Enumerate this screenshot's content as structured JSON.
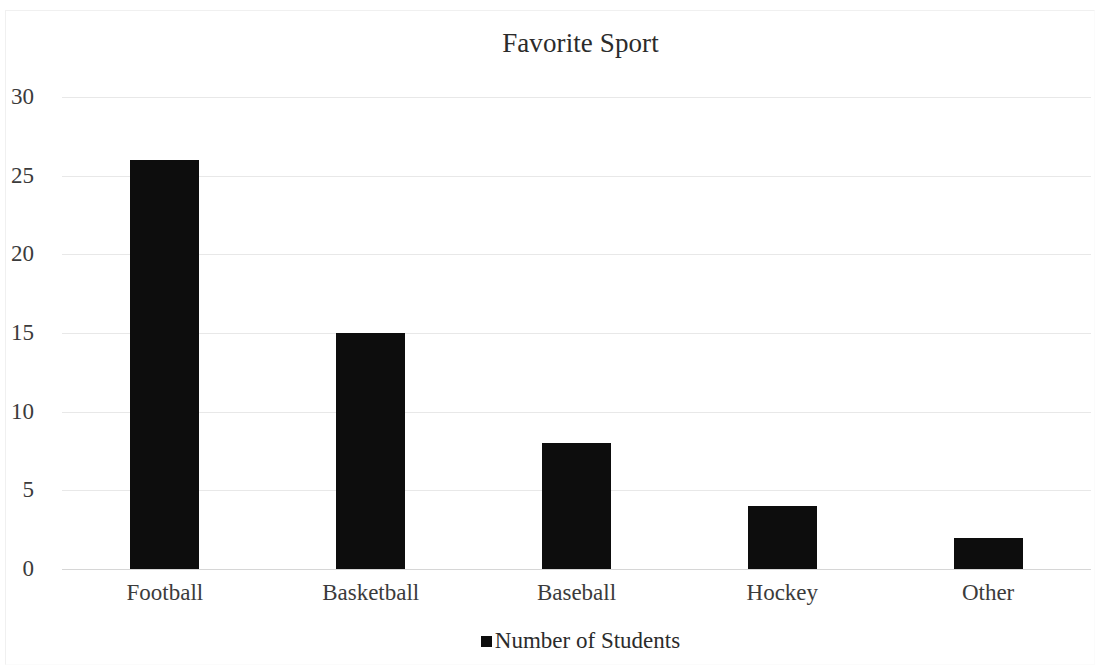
{
  "chart_data": {
    "type": "bar",
    "title": "Favorite Sport",
    "categories": [
      "Football",
      "Basketball",
      "Baseball",
      "Hockey",
      "Other"
    ],
    "values": [
      26,
      15,
      8,
      4,
      2
    ],
    "series": [
      {
        "name": "Number of Students",
        "values": [
          26,
          15,
          8,
          4,
          2
        ],
        "color": "#0d0d0d"
      }
    ],
    "xlabel": "",
    "ylabel": "",
    "ylim": [
      0,
      30
    ],
    "yticks": [
      0,
      5,
      10,
      15,
      20,
      25,
      30
    ],
    "ytick_labels": [
      "0",
      "5",
      "10",
      "15",
      "20",
      "25",
      "30"
    ],
    "grid": true,
    "grid_axis": "y",
    "grid_color": "#e8e8e8",
    "legend": {
      "position": "bottom",
      "entries": [
        {
          "label": "Number of Students",
          "marker": "square-marker",
          "color": "#0d0d0d"
        }
      ]
    },
    "background_color": "#ffffff",
    "text_color": "#2b2b2b"
  }
}
